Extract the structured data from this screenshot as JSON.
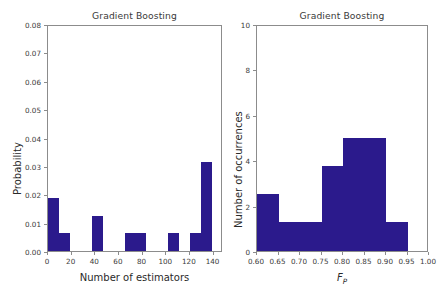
{
  "figure": {
    "background": "#ffffff",
    "bar_color": "#2b1a8c",
    "axis_color": "#8c8c8c"
  },
  "panels": [
    {
      "id": "left",
      "title": "Gradient Boosting",
      "xlabel": "Number of estimators",
      "ylabel": "Probability",
      "xticks": [
        "0",
        "20",
        "40",
        "60",
        "80",
        "100",
        "120",
        "140"
      ],
      "yticks": [
        "0.00",
        "0.01",
        "0.02",
        "0.03",
        "0.04",
        "0.05",
        "0.06",
        "0.07",
        "0.08"
      ]
    },
    {
      "id": "right",
      "title": "Gradient Boosting",
      "xlabel_main": "F",
      "xlabel_sub": "P",
      "ylabel": "Number of occurrences",
      "xticks": [
        "0.60",
        "0.65",
        "0.70",
        "0.75",
        "0.80",
        "0.85",
        "0.90",
        "0.95",
        "1.00"
      ],
      "yticks": [
        "0",
        "2",
        "4",
        "6",
        "8",
        "10"
      ]
    }
  ],
  "chart_data": [
    {
      "type": "bar",
      "panel": "left",
      "title": "Gradient Boosting",
      "xlabel": "Number of estimators",
      "ylabel": "Probability",
      "xlim": [
        0,
        148
      ],
      "ylim": [
        0.0,
        0.08
      ],
      "grid": false,
      "legend": null,
      "bin_edges": [
        0,
        9.25,
        18.5,
        27.75,
        37,
        46.25,
        55.5,
        64.75,
        74,
        83.25,
        92.5,
        101.75,
        111,
        120.25,
        129.5,
        138.75,
        148
      ],
      "bin_centers": [
        4.6,
        13.9,
        23.1,
        32.4,
        41.6,
        50.9,
        60.1,
        69.4,
        78.6,
        87.9,
        97.1,
        106.4,
        115.6,
        124.9,
        134.1,
        143.4
      ],
      "values": [
        0.0188,
        0.0063,
        0.0,
        0.0,
        0.0125,
        0.0,
        0.0,
        0.0063,
        0.0063,
        0.0,
        0.0,
        0.0063,
        0.0,
        0.0063,
        0.0313,
        0.0
      ]
    },
    {
      "type": "bar",
      "panel": "right",
      "title": "Gradient Boosting",
      "xlabel": "F_P",
      "ylabel": "Number of occurrences",
      "xlim": [
        0.6,
        1.0
      ],
      "ylim": [
        0,
        10
      ],
      "grid": false,
      "legend": null,
      "bin_edges": [
        0.6,
        0.65,
        0.7,
        0.75,
        0.8,
        0.85,
        0.9,
        0.95,
        1.0
      ],
      "bin_centers": [
        0.625,
        0.675,
        0.725,
        0.775,
        0.825,
        0.875,
        0.925,
        0.975
      ],
      "values": [
        2.5,
        1.3,
        1.3,
        3.75,
        5.0,
        5.0,
        1.3,
        0.0
      ]
    }
  ]
}
